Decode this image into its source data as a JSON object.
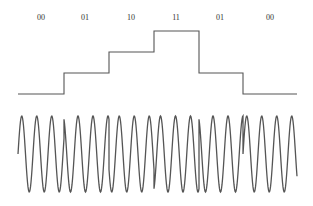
{
  "diagram": {
    "type": "4-level digital signal with phase-modulated carrier (QPSK)",
    "colors": {
      "line": "#555555",
      "text": "#333333",
      "background": "#ffffff"
    },
    "symbols": [
      {
        "label": "00",
        "level": 0,
        "x_start": 18,
        "x_end": 64,
        "label_x": 41,
        "phase_deg": 0
      },
      {
        "label": "01",
        "level": 1,
        "x_start": 64,
        "x_end": 109,
        "label_x": 85,
        "phase_deg": 90
      },
      {
        "label": "10",
        "level": 2,
        "x_start": 109,
        "x_end": 154,
        "label_x": 131,
        "phase_deg": 180
      },
      {
        "label": "11",
        "level": 3,
        "x_start": 154,
        "x_end": 199,
        "label_x": 176,
        "phase_deg": 270
      },
      {
        "label": "01",
        "level": 1,
        "x_start": 199,
        "x_end": 243,
        "label_x": 220,
        "phase_deg": 90
      },
      {
        "label": "00",
        "level": 0,
        "x_start": 243,
        "x_end": 297,
        "label_x": 270,
        "phase_deg": 0
      }
    ],
    "staircase": {
      "level_y": [
        94,
        73,
        52,
        31
      ]
    },
    "carrier": {
      "center_y": 154,
      "amplitude": 38,
      "period_px": 15
    },
    "label_y": 20
  }
}
